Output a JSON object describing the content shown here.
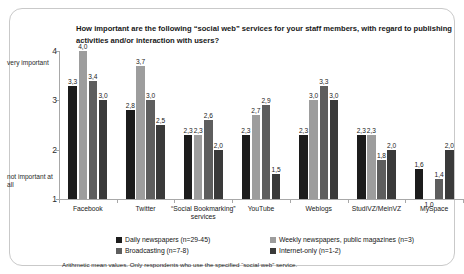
{
  "chart_data": {
    "type": "bar",
    "title": "How important are the following “social web” services for your staff members, with regard to publishing activities and/or interaction with users?",
    "xlabel": "",
    "ylabel": "",
    "ylim": [
      1,
      4
    ],
    "yticks": [
      1,
      2,
      3,
      4
    ],
    "ytick_labels": [
      "1",
      "2",
      "3",
      "4"
    ],
    "y_top_caption": "very important",
    "y_bottom_caption": "not important at all",
    "grid": false,
    "legend_position": "bottom",
    "decimal_separator": ",",
    "categories": [
      "Facebook",
      "Twitter",
      "“Social Bookmarking” services",
      "YouTube",
      "Weblogs",
      "StudiVZ/MeinVZ",
      "MySpace"
    ],
    "series": [
      {
        "name": "Daily newspapers (n=29-45)",
        "color": "#1c1c1c",
        "values": [
          3.3,
          2.8,
          2.3,
          2.3,
          2.3,
          2.3,
          1.6
        ],
        "labels": [
          "3,3",
          "2,8",
          "2,3",
          "2,3",
          "2,3",
          "2,3",
          "1,6"
        ]
      },
      {
        "name": "Weekly newspapers, public magazines (n=3)",
        "color": "#9d9d9d",
        "values": [
          4.0,
          3.7,
          2.3,
          2.7,
          3.0,
          2.3,
          1.0
        ],
        "labels": [
          "4,0",
          "3,7",
          "2,3",
          "2,7",
          "3,0",
          "2,3",
          "1,0"
        ]
      },
      {
        "name": "Broadcasting (n=7-8)",
        "color": "#5e5e5e",
        "values": [
          3.4,
          3.0,
          2.6,
          2.9,
          3.3,
          1.8,
          1.4
        ],
        "labels": [
          "3,4",
          "3,0",
          "2,6",
          "2,9",
          "3,3",
          "1,8",
          "1,4"
        ]
      },
      {
        "name": "Internet-only (n=1-2)",
        "color": "#3a3a3a",
        "values": [
          3.0,
          2.5,
          2.0,
          1.5,
          3.0,
          2.0,
          2.0
        ],
        "labels": [
          "3,0",
          "2,5",
          "2,0",
          "1,5",
          "3,0",
          "2,0",
          "2,0"
        ]
      }
    ],
    "annotation": "Arithmetic mean values. Only respondents who use the specified “social web” service."
  }
}
